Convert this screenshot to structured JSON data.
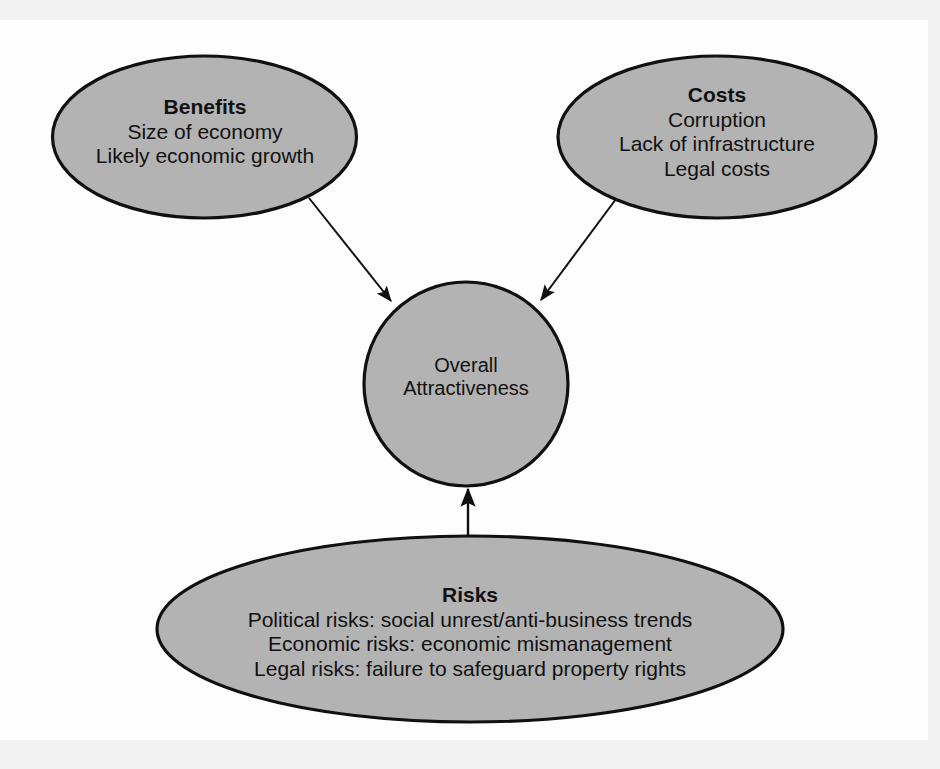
{
  "figure": {
    "background_color": "#f2f2f2",
    "panel_color": "#fdfdfd",
    "shape_fill": "#b3b3b3",
    "shape_stroke": "#101010",
    "text_color": "#111111"
  },
  "nodes": {
    "benefits": {
      "title": "Benefits",
      "lines": [
        "Size of economy",
        "Likely economic growth"
      ]
    },
    "costs": {
      "title": "Costs",
      "lines": [
        "Corruption",
        "Lack of infrastructure",
        "Legal costs"
      ]
    },
    "center": {
      "lines": [
        "Overall",
        "Attractiveness"
      ]
    },
    "risks": {
      "title": "Risks",
      "lines": [
        "Political risks: social unrest/anti-business trends",
        "Economic risks: economic mismanagement",
        "Legal risks: failure to safeguard property rights"
      ]
    }
  },
  "connectors": [
    {
      "name": "benefits-to-center",
      "from": "benefits",
      "to": "center",
      "direction": "down-right"
    },
    {
      "name": "costs-to-center",
      "from": "costs",
      "to": "center",
      "direction": "down-left"
    },
    {
      "name": "risks-to-center",
      "from": "risks",
      "to": "center",
      "direction": "up"
    }
  ]
}
